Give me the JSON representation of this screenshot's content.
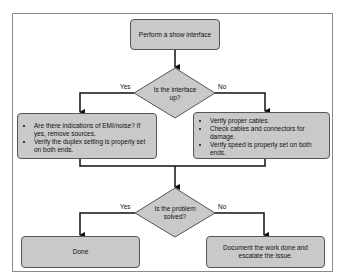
{
  "flowchart": {
    "start": {
      "label": "Perform a show interface"
    },
    "decision1": {
      "label": "Is the interface up?",
      "yes_label": "Yes",
      "no_label": "No"
    },
    "yes_box": {
      "items": [
        "Are there indications of EMI/noise? If yes, remove sources.",
        "Verify the duplex setting is properly set on both ends."
      ]
    },
    "no_box": {
      "items": [
        "Verify proper cables.",
        "Check cables and connectors for damage.",
        "Verify speed is properly set on both ends."
      ]
    },
    "decision2": {
      "label": "Is the problem solved?",
      "yes_label": "Yes",
      "no_label": "No"
    },
    "done_box": {
      "label": "Done"
    },
    "escalate_box": {
      "label": "Document the work done and escalate the issue."
    },
    "colors": {
      "box_fill": "#c9c9c9",
      "box_border": "#555555",
      "line": "#111111",
      "frame": "#8a8a8a"
    }
  }
}
